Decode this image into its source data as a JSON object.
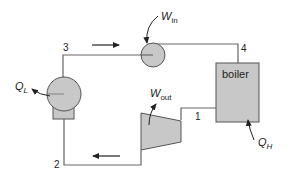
{
  "diagram": {
    "type": "thermodynamic-cycle",
    "components": {
      "boiler": {
        "label": "boiler"
      },
      "pump": {
        "label": ""
      },
      "turbine": {
        "label": ""
      },
      "condenser": {
        "label": ""
      }
    },
    "states": [
      "1",
      "2",
      "3",
      "4"
    ],
    "energy": {
      "w_in": {
        "main": "W",
        "sub": "in"
      },
      "w_out": {
        "main": "W",
        "sub": "out"
      },
      "q_l": {
        "main": "Q",
        "sub": "L"
      },
      "q_h": {
        "main": "Q",
        "sub": "H"
      }
    },
    "colors": {
      "fill": "#c8c8c8",
      "stroke": "#555555",
      "line": "#666666"
    }
  }
}
